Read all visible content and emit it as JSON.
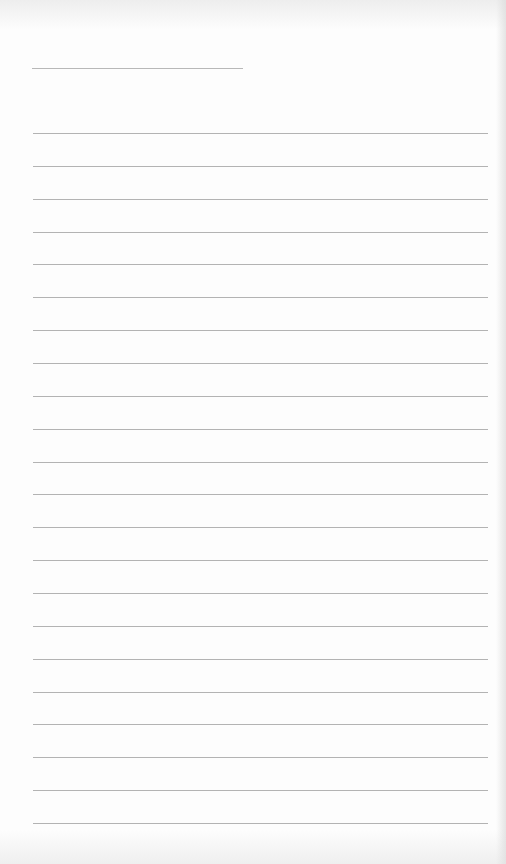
{
  "document": {
    "type": "blank lined sheet",
    "header_line": {
      "x": 32,
      "y": 68,
      "width": 211
    },
    "ruled_lines": {
      "count": 22,
      "x": 33,
      "width": 455,
      "first_y": 133,
      "spacing": 32.86,
      "color": "#b3b3b3"
    },
    "paper_color": "#fdfdfd"
  }
}
